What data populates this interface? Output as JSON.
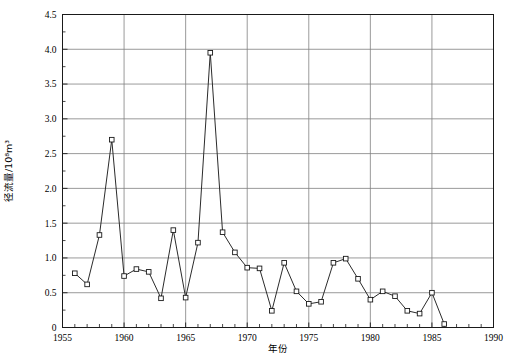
{
  "chart_data": {
    "type": "line",
    "title": "",
    "xlabel": "年份",
    "ylabel": "径流量/10⁸m³",
    "xlim": [
      1955,
      1990
    ],
    "ylim": [
      0,
      4.5
    ],
    "xticks": [
      1955,
      1960,
      1965,
      1970,
      1975,
      1980,
      1985,
      1990
    ],
    "xtick_labels": [
      "1955",
      "1960",
      "1965",
      "1970",
      "1975",
      "1980",
      "1985",
      "1990"
    ],
    "yticks": [
      0,
      0.5,
      1.0,
      1.5,
      2.0,
      2.5,
      3.0,
      3.5,
      4.0,
      4.5
    ],
    "ytick_labels": [
      "0",
      "0.5",
      "1.0",
      "1.5",
      "2.0",
      "2.5",
      "3.0",
      "3.5",
      "4.0",
      "4.5"
    ],
    "xtick_minor_step": 1,
    "ytick_minor_step": 0.25,
    "grid": "horizontal-and-vertical-major",
    "legend": "none",
    "marker": "open-square",
    "line_color": "#2b2b2b",
    "grid_color": "#808080",
    "axis_color": "#1a1a1a",
    "x": [
      1956,
      1957,
      1958,
      1959,
      1960,
      1961,
      1962,
      1963,
      1964,
      1965,
      1966,
      1967,
      1968,
      1969,
      1970,
      1971,
      1972,
      1973,
      1974,
      1975,
      1976,
      1977,
      1978,
      1979,
      1980,
      1981,
      1982,
      1983,
      1984,
      1985,
      1986
    ],
    "values": [
      0.78,
      0.62,
      1.33,
      2.7,
      0.74,
      0.84,
      0.8,
      0.42,
      1.4,
      0.43,
      1.22,
      3.95,
      1.37,
      1.08,
      0.86,
      0.85,
      0.24,
      0.93,
      0.52,
      0.34,
      0.37,
      0.93,
      0.99,
      0.7,
      0.4,
      0.52,
      0.45,
      0.24,
      0.2,
      0.5,
      0.05
    ],
    "series": [
      {
        "name": "径流量",
        "values": [
          0.78,
          0.62,
          1.33,
          2.7,
          0.74,
          0.84,
          0.8,
          0.42,
          1.4,
          0.43,
          1.22,
          3.95,
          1.37,
          1.08,
          0.86,
          0.85,
          0.24,
          0.93,
          0.52,
          0.34,
          0.37,
          0.93,
          0.99,
          0.7,
          0.4,
          0.52,
          0.45,
          0.24,
          0.2,
          0.5,
          0.05
        ]
      }
    ]
  }
}
